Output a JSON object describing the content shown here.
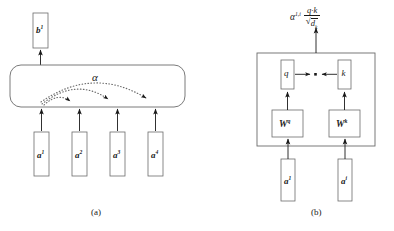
{
  "figure": {
    "panels": [
      {
        "id": "panel-a",
        "caption": "(a)",
        "output_label": "b",
        "output_sup": "1",
        "attention_label": "α",
        "inputs": [
          {
            "label": "a",
            "sup": "1"
          },
          {
            "label": "a",
            "sup": "2"
          },
          {
            "label": "a",
            "sup": "3"
          },
          {
            "label": "a",
            "sup": "4"
          }
        ]
      },
      {
        "id": "panel-b",
        "caption": "(b)",
        "formula": {
          "alpha": "α",
          "alpha_sup": "1,i",
          "numerator": "q·k",
          "denominator_radical": "√",
          "denominator_body": "d",
          "denominator_sub": "k"
        },
        "query_label": "q",
        "key_label": "k",
        "dot_symbol": "·",
        "weight_q_label": "W",
        "weight_q_sup": "q",
        "weight_k_label": "W",
        "weight_k_sup": "k",
        "inputs": [
          {
            "label": "a",
            "sup": "1"
          },
          {
            "label": "a",
            "sup": "i"
          }
        ]
      }
    ]
  },
  "style": {
    "stroke": "#4a4a4a",
    "text": "#1a1a1a",
    "background": "#ffffff"
  }
}
